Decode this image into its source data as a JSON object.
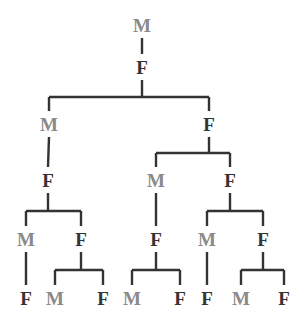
{
  "colors": {
    "M": "#8a8a8a",
    "F": "#333333",
    "edge": "#333333"
  },
  "tree": {
    "label": "M",
    "children": [
      {
        "label": "F",
        "children": [
          {
            "label": "M",
            "children": [
              {
                "label": "F",
                "children": [
                  {
                    "label": "M",
                    "children": [
                      {
                        "label": "F"
                      }
                    ]
                  },
                  {
                    "label": "F",
                    "children": [
                      {
                        "label": "M"
                      },
                      {
                        "label": "F"
                      }
                    ]
                  }
                ]
              }
            ]
          },
          {
            "label": "F",
            "children": [
              {
                "label": "M",
                "children": [
                  {
                    "label": "F",
                    "children": [
                      {
                        "label": "M"
                      },
                      {
                        "label": "F"
                      }
                    ]
                  }
                ]
              },
              {
                "label": "F",
                "children": [
                  {
                    "label": "M",
                    "children": [
                      {
                        "label": "F"
                      }
                    ]
                  },
                  {
                    "label": "F",
                    "children": [
                      {
                        "label": "M"
                      },
                      {
                        "label": "F"
                      }
                    ]
                  }
                ]
              }
            ]
          }
        ]
      }
    ]
  }
}
